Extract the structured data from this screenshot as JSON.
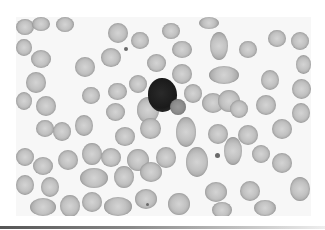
{
  "image": {
    "subject": "peripheral blood smear micrograph",
    "description": "Field of red blood cells surrounding a single dark-stained lymphocyte",
    "colors": {
      "background": "#f7f7f7",
      "rbc": "#c2c2c2",
      "lymphocyte_nucleus": "#1a1a1a",
      "bottom_rule": "#666666"
    }
  }
}
